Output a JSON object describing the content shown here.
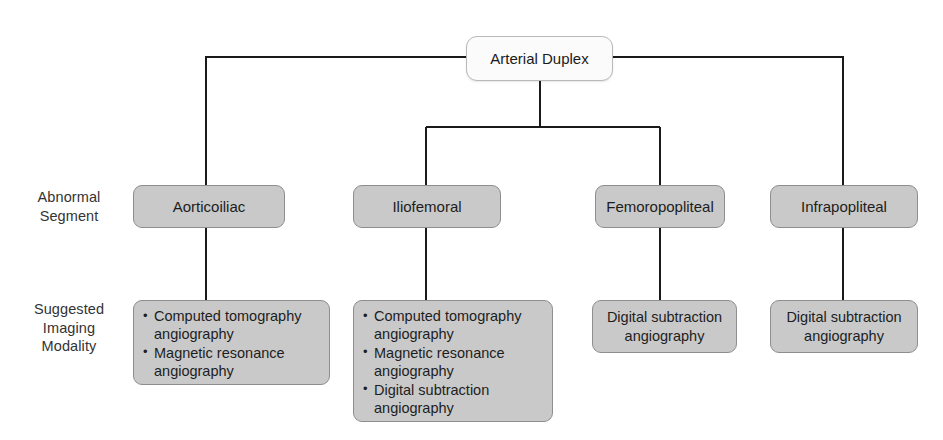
{
  "diagram": {
    "root": {
      "label": "Arterial Duplex"
    },
    "row_labels": {
      "segment": "Abnormal Segment",
      "segment_line1": "Abnormal",
      "segment_line2": "Segment",
      "modality": "Suggested Imaging Modality",
      "modality_line1": "Suggested",
      "modality_line2": "Imaging",
      "modality_line3": "Modality"
    },
    "branches": [
      {
        "segment": "Aorticoiliac",
        "modalities": [
          "Computed tomography angiography",
          "Magnetic resonance angiography"
        ]
      },
      {
        "segment": "Iliofemoral",
        "modalities": [
          "Computed tomography angiography",
          "Magnetic resonance angiography",
          "Digital subtraction angiography"
        ]
      },
      {
        "segment": "Femoropopliteal",
        "modalities": [
          "Digital subtraction angiography"
        ]
      },
      {
        "segment": "Infrapopliteal",
        "modalities": [
          "Digital subtraction angiography"
        ]
      }
    ],
    "colors": {
      "node_fill": "#c9c9c9",
      "node_border": "#8e8e8e",
      "root_fill": "#fbfbfb",
      "root_border": "#b9b9b9",
      "connector": "#1a1a1a",
      "background": "#ffffff",
      "text": "#1d1d1d",
      "label_text": "#333333"
    }
  }
}
